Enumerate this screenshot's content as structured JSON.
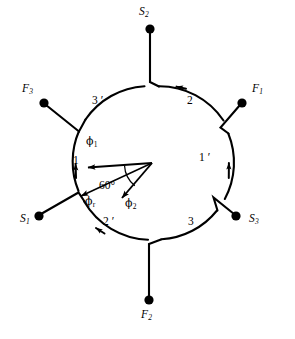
{
  "figure": {
    "type": "three-phase-winding-diagram",
    "stroke_color": "#000000",
    "background_color": "#ffffff"
  },
  "circle": {
    "center_x": 152,
    "center_y": 163,
    "radius": 77
  },
  "terminals": [
    {
      "id": "S2",
      "label": "S",
      "sub": "2",
      "label_x": 140,
      "label_y": 8,
      "dot_x": 150,
      "dot_y": 29,
      "position": "top"
    },
    {
      "id": "F1",
      "label": "F",
      "sub": "1",
      "label_x": 246,
      "label_y": 85,
      "dot_x": 242,
      "dot_y": 103,
      "position": "upper-right"
    },
    {
      "id": "S3",
      "label": "S",
      "sub": "3",
      "label_x": 248,
      "label_y": 215,
      "dot_x": 236,
      "dot_y": 216,
      "position": "lower-right"
    },
    {
      "id": "F2",
      "label": "F",
      "sub": "2",
      "label_x": 141,
      "label_y": 317,
      "dot_x": 149,
      "dot_y": 300,
      "position": "bottom"
    },
    {
      "id": "S1",
      "label": "S",
      "sub": "1",
      "label_x": 20,
      "label_y": 215,
      "dot_x": 39,
      "dot_y": 216,
      "position": "lower-left"
    },
    {
      "id": "F3",
      "label": "F",
      "sub": "3",
      "label_x": 24,
      "label_y": 85,
      "dot_x": 44,
      "dot_y": 103,
      "position": "upper-left"
    }
  ],
  "arc_labels": [
    {
      "id": "arc-3-prime",
      "text": "3 ′",
      "x": 96,
      "y": 101,
      "segment": "upper-left"
    },
    {
      "id": "arc-2",
      "text": "2",
      "x": 190,
      "y": 101,
      "segment": "upper-right"
    },
    {
      "id": "arc-1-prime",
      "text": "1 ′",
      "x": 205,
      "y": 158,
      "segment": "right"
    },
    {
      "id": "arc-3",
      "text": "3",
      "x": 191,
      "y": 222,
      "segment": "lower-right"
    },
    {
      "id": "arc-2-prime",
      "text": "2 ′",
      "x": 107,
      "y": 222,
      "segment": "lower-left"
    },
    {
      "id": "arc-1",
      "text": "1",
      "x": 73,
      "y": 161,
      "segment": "left"
    }
  ],
  "phasors": [
    {
      "id": "phi1",
      "symbol": "ϕ",
      "sub": "1",
      "label_x": 89,
      "label_y": 143,
      "from_x": 152,
      "from_y": 163,
      "to_x": 86,
      "to_y": 168,
      "direction_deg": 184
    },
    {
      "id": "phir",
      "symbol": "ϕ",
      "sub": "r",
      "label_x": 88,
      "label_y": 200,
      "from_x": 152,
      "from_y": 163,
      "to_x": 79,
      "to_y": 197,
      "direction_deg": 205
    },
    {
      "id": "phi2",
      "symbol": "ϕ",
      "sub": "2",
      "label_x": 127,
      "label_y": 202,
      "from_x": 152,
      "from_y": 163,
      "to_x": 120,
      "to_y": 200,
      "direction_deg": 229
    }
  ],
  "angle_annotation": {
    "id": "angle-60",
    "text": "60°",
    "value": 60,
    "unit": "degrees",
    "label_x": 105,
    "label_y": 187,
    "between": [
      "phi1",
      "phi2"
    ]
  }
}
